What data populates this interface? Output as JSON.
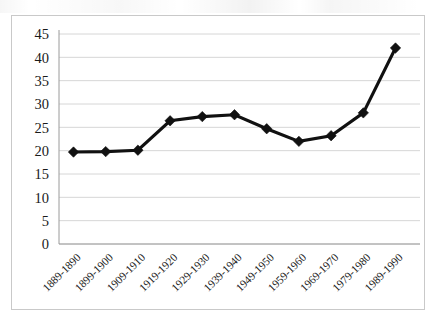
{
  "chart_data": {
    "type": "line",
    "title": "",
    "xlabel": "",
    "ylabel": "",
    "categories": [
      "1889-1890",
      "1899-1900",
      "1909-1910",
      "1919-1920",
      "1929-1930",
      "1939-1940",
      "1949-1950",
      "1959-1960",
      "1969-1970",
      "1979-1980",
      "1989-1990"
    ],
    "values": [
      19.7,
      19.8,
      20.1,
      26.4,
      27.3,
      27.7,
      24.7,
      22.0,
      23.2,
      28.1,
      42.0
    ],
    "series": [
      {
        "name": "series-1",
        "values": [
          19.7,
          19.8,
          20.1,
          26.4,
          27.3,
          27.7,
          24.7,
          22.0,
          23.2,
          28.1,
          42.0
        ]
      }
    ],
    "ylim": [
      0,
      45
    ],
    "yticks": [
      0,
      5,
      10,
      15,
      20,
      25,
      30,
      35,
      40,
      45
    ],
    "ytick_labels": [
      "0",
      "5",
      "10",
      "15",
      "20",
      "25",
      "30",
      "35",
      "40",
      "45"
    ],
    "grid": true,
    "grid_axis": "y",
    "legend": false,
    "legend_position": "none",
    "marker": "diamond",
    "xtick_rotation_degrees": 45,
    "colors": {
      "line": "#111111",
      "marker": "#111111",
      "gridline": "#d6d6d6",
      "axis": "#9a9a9a",
      "frame_border": "#c9c9c9",
      "plot_background": "#ffffff",
      "tick_label": "#1a1a1a"
    }
  }
}
